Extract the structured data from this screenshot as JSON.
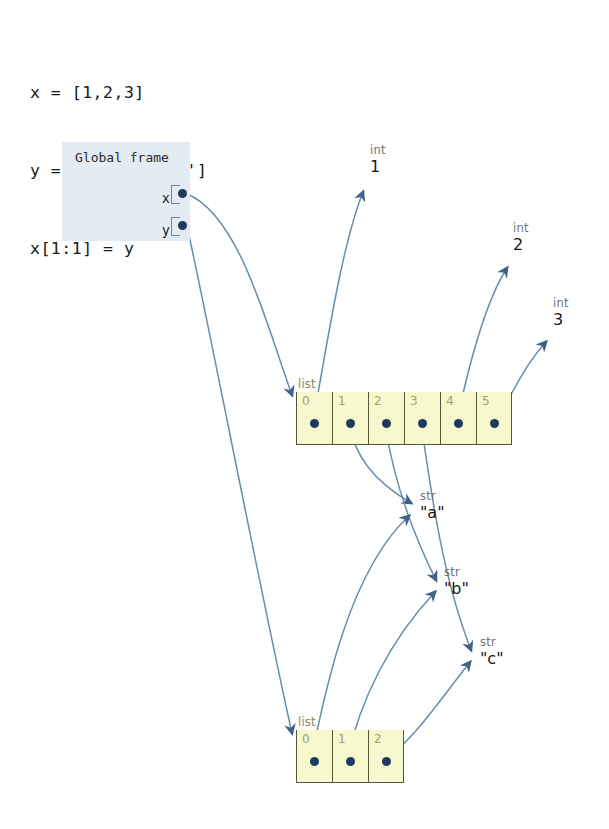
{
  "code": {
    "lines": [
      "x = [1,2,3]",
      "y = ['a','b','c']",
      "x[1:1] = y"
    ]
  },
  "frame": {
    "title": "Global frame",
    "variables": [
      {
        "name": "x",
        "points_to": "list-top"
      },
      {
        "name": "y",
        "points_to": "list-bottom"
      }
    ]
  },
  "lists": [
    {
      "id": "list-top",
      "label": "list",
      "length": 6,
      "indices": [
        "0",
        "1",
        "2",
        "3",
        "4",
        "5"
      ],
      "targets": [
        "int-1",
        "str-a",
        "str-b",
        "str-c",
        "int-2",
        "int-3"
      ]
    },
    {
      "id": "list-bottom",
      "label": "list",
      "length": 3,
      "indices": [
        "0",
        "1",
        "2"
      ],
      "targets": [
        "str-a",
        "str-b",
        "str-c"
      ]
    }
  ],
  "values": [
    {
      "id": "int-1",
      "type": "int",
      "value": "1"
    },
    {
      "id": "int-2",
      "type": "int",
      "value": "2"
    },
    {
      "id": "int-3",
      "type": "int",
      "value": "3"
    },
    {
      "id": "str-a",
      "type": "str",
      "value": "\"a\""
    },
    {
      "id": "str-b",
      "type": "str",
      "value": "\"b\""
    },
    {
      "id": "str-c",
      "type": "str",
      "value": "\"c\""
    }
  ],
  "colors": {
    "frame_background": "#e4ecf3",
    "list_cell_background": "#f8f8cf",
    "list_cell_border": "#55553a",
    "pointer_dot": "#1f3a5f",
    "arrow": "#5b7d9e",
    "index_label": "#a0a072",
    "type_label": "#6f7479",
    "page_background": "#ffffff"
  }
}
